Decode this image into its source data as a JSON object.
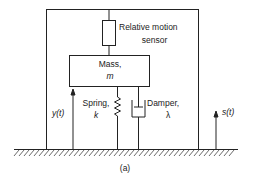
{
  "diagram": {
    "sensor": {
      "line1": "Relative motion",
      "line2": "sensor"
    },
    "mass": {
      "line1": "Mass,",
      "line2": "m"
    },
    "spring": {
      "line1": "Spring,",
      "line2": "k"
    },
    "damper": {
      "line1": "Damper,",
      "line2": "λ"
    },
    "y_label": "y(t)",
    "s_label": "s(t)",
    "caption": "(a)"
  }
}
